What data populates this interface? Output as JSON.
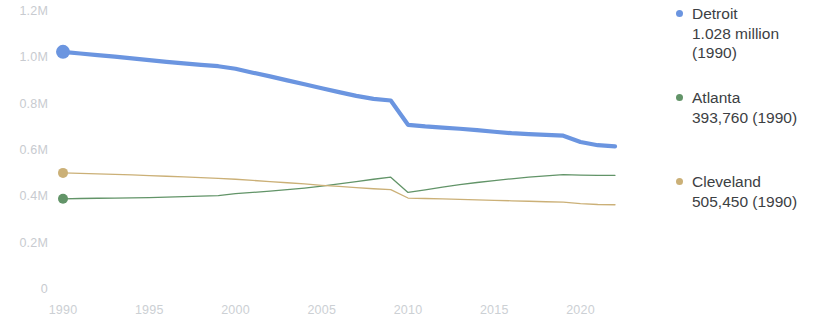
{
  "chart_data": {
    "type": "line",
    "title": "",
    "xlabel": "",
    "ylabel": "",
    "xlim": [
      1990,
      2022
    ],
    "ylim": [
      0,
      1200000
    ],
    "grid": false,
    "legend_position": "right",
    "x_tick_labels": [
      "1990",
      "1995",
      "2000",
      "2005",
      "2010",
      "2015",
      "2020"
    ],
    "x_ticks": [
      1990,
      1995,
      2000,
      2005,
      2010,
      2015,
      2020
    ],
    "y_tick_labels": [
      "1.2M",
      "1.0M",
      "0.8M",
      "0.6M",
      "0.4M",
      "0.2M",
      "0"
    ],
    "y_ticks": [
      1200000,
      1000000,
      800000,
      600000,
      400000,
      200000,
      0
    ],
    "x": [
      1990,
      1991,
      1992,
      1993,
      1994,
      1995,
      1996,
      1997,
      1998,
      1999,
      2000,
      2001,
      2002,
      2003,
      2004,
      2005,
      2006,
      2007,
      2008,
      2009,
      2010,
      2011,
      2012,
      2013,
      2014,
      2015,
      2016,
      2017,
      2018,
      2019,
      2020,
      2021,
      2022
    ],
    "series": [
      {
        "name": "Detroit",
        "color": "#6b95e0",
        "start_marker": true,
        "values": [
          1028000,
          1021000,
          1014000,
          1007000,
          1000000,
          992000,
          985000,
          978000,
          972000,
          966000,
          955000,
          938000,
          922000,
          905000,
          888000,
          871000,
          854000,
          838000,
          825000,
          818000,
          713000,
          706000,
          701000,
          696000,
          690000,
          683000,
          677000,
          673000,
          670000,
          666000,
          639000,
          625000,
          620000
        ]
      },
      {
        "name": "Atlanta",
        "color": "#629468",
        "start_marker": true,
        "values": [
          393760,
          395000,
          396000,
          397000,
          398000,
          399000,
          401000,
          403000,
          405000,
          407000,
          416000,
          421000,
          427000,
          433000,
          440000,
          448000,
          458000,
          468000,
          478000,
          487000,
          421000,
          432000,
          444000,
          455000,
          464000,
          472000,
          480000,
          487000,
          493000,
          498000,
          496000,
          495000,
          495000
        ]
      },
      {
        "name": "Cleveland",
        "color": "#cbb077",
        "start_marker": true,
        "values": [
          505450,
          503000,
          501000,
          499000,
          497000,
          494000,
          491000,
          488000,
          485000,
          482000,
          478000,
          473000,
          468000,
          463000,
          458000,
          452000,
          447000,
          442000,
          437000,
          433000,
          397000,
          395000,
          393000,
          391000,
          389000,
          387000,
          385000,
          383000,
          381000,
          379000,
          373000,
          369000,
          368000
        ]
      }
    ]
  },
  "legend": {
    "items": [
      {
        "name": "Detroit",
        "value": "1.028 million\n(1990)",
        "color": "#6b95e0"
      },
      {
        "name": "Atlanta",
        "value": "393,760 (1990)",
        "color": "#629468"
      },
      {
        "name": "Cleveland",
        "value": "505,450 (1990)",
        "color": "#cbb077"
      }
    ]
  }
}
